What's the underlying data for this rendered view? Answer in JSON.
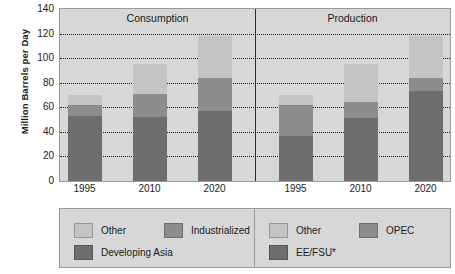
{
  "chart_data": {
    "type": "bar",
    "subtype": "stacked-bar",
    "title": "",
    "xlabel": "",
    "ylabel": "Million Barrels per Day",
    "ylim": [
      0,
      140
    ],
    "yticks": [
      0,
      20,
      40,
      60,
      80,
      100,
      120,
      140
    ],
    "grid": true,
    "gridlines_at": [
      20,
      40,
      60,
      80,
      100,
      120
    ],
    "legend_position": "bottom",
    "panels": [
      {
        "name": "Consumption",
        "categories": [
          "1995",
          "2010",
          "2020"
        ],
        "series": [
          {
            "name": "Developing Asia",
            "color": "#6e6e6e",
            "values": [
              53,
              52,
              57
            ]
          },
          {
            "name": "Industrialized",
            "color": "#8d8d8d",
            "values": [
              9,
              19,
              27
            ]
          },
          {
            "name": "Other",
            "color": "#c4c4c4",
            "values": [
              8,
              24,
              34
            ]
          }
        ],
        "totals": [
          70,
          95,
          118
        ]
      },
      {
        "name": "Production",
        "categories": [
          "1995",
          "2010",
          "2020"
        ],
        "series": [
          {
            "name": "EE/FSU*",
            "color": "#6e6e6e",
            "values": [
              37,
              51,
              73
            ]
          },
          {
            "name": "OPEC",
            "color": "#8d8d8d",
            "values": [
              25,
              13,
              11
            ]
          },
          {
            "name": "Other",
            "color": "#c4c4c4",
            "values": [
              8,
              31,
              34
            ]
          }
        ],
        "totals": [
          70,
          95,
          118
        ]
      }
    ]
  },
  "axis": {
    "y_title": "Million Barrels per Day",
    "y_tick_labels": [
      "140",
      "120",
      "100",
      "80",
      "60",
      "40",
      "20",
      "0"
    ],
    "x_tick_labels_left": [
      "1995",
      "2010",
      "2020"
    ],
    "x_tick_labels_right": [
      "1995",
      "2010",
      "2020"
    ]
  },
  "panels": {
    "left_title": "Consumption",
    "right_title": "Production"
  },
  "legend_left": {
    "items": [
      {
        "label": "Other",
        "color": "#c4c4c4"
      },
      {
        "label": "Industrialized",
        "color": "#8d8d8d"
      },
      {
        "label": "Developing Asia",
        "color": "#6e6e6e"
      }
    ]
  },
  "legend_right": {
    "items": [
      {
        "label": "Other",
        "color": "#c4c4c4"
      },
      {
        "label": "OPEC",
        "color": "#8d8d8d"
      },
      {
        "label": "EE/FSU*",
        "color": "#6e6e6e"
      }
    ]
  },
  "colors": {
    "plot_background": "#d7d7d7",
    "page_background": "#ffffff",
    "text": "#1a1a1a",
    "gridline": "#1a1a1a",
    "border": "#9a9a9a",
    "divider": "#2a2a2a"
  }
}
